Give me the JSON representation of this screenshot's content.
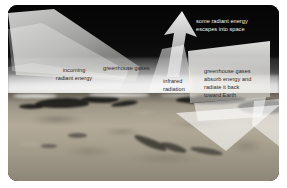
{
  "figure": {
    "scene": "Earth limb viewed from space with atmospheric glow"
  },
  "labels": {
    "escape": "some radiant energy\nescapes into space",
    "incoming": "incoming\nradiant energy",
    "greenhouse_gases": "greenhouse gases",
    "infrared": "infrared\nradiation",
    "absorb": "greenhouse gases\nabsorb energy and\nradiate it back\ntoward Earth"
  },
  "arrows": {
    "incoming_beam": "incoming-radiant-energy-beam",
    "escaping_arrow": "escaping-radiation-up-arrow",
    "infrared_beam": "infrared-radiation-beam",
    "reradiated_arrow": "reradiated-energy-down-arrow"
  },
  "colors": {
    "space": "#050505",
    "atmosphere_glow": "#ffffff",
    "earth_surface": "#a49c8c",
    "landmass": "#161512",
    "beam_overlay": "#f5f5f2",
    "label_dark": "#2a2a2a",
    "label_light": "#f2f2f2",
    "page_background": "#ffffff"
  }
}
